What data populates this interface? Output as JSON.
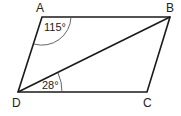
{
  "figure": {
    "shape": "parallelogram",
    "vertices": [
      {
        "label": "A",
        "x": 42,
        "y": 17
      },
      {
        "label": "B",
        "x": 170,
        "y": 17
      },
      {
        "label": "C",
        "x": 147,
        "y": 92
      },
      {
        "label": "D",
        "x": 18,
        "y": 92
      }
    ],
    "diagonal": "BD",
    "angles": [
      {
        "at": "A",
        "value": "115°"
      },
      {
        "at": "D",
        "between": "BD and DC",
        "value": "28°"
      }
    ],
    "line_color": "#1a1a1a"
  }
}
